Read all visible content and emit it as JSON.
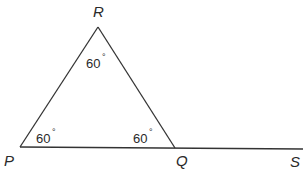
{
  "diagram": {
    "type": "geometry-triangle-exterior-angle",
    "points": {
      "P": {
        "label": "P",
        "x": 20,
        "y": 147
      },
      "Q": {
        "label": "Q",
        "x": 175,
        "y": 148
      },
      "R": {
        "label": "R",
        "x": 98,
        "y": 27
      },
      "S": {
        "label": "S",
        "x": 303,
        "y": 149
      }
    },
    "segments": [
      {
        "from": "P",
        "to": "R"
      },
      {
        "from": "R",
        "to": "Q"
      },
      {
        "from": "P",
        "to": "S"
      }
    ],
    "angles": {
      "R": {
        "value": "60",
        "unit": "°"
      },
      "P": {
        "value": "60",
        "unit": "°"
      },
      "Q": {
        "value": "60",
        "unit": "°"
      }
    },
    "colors": {
      "line": "#333333",
      "text": "#2a2a2a",
      "background": "#ffffff"
    }
  }
}
